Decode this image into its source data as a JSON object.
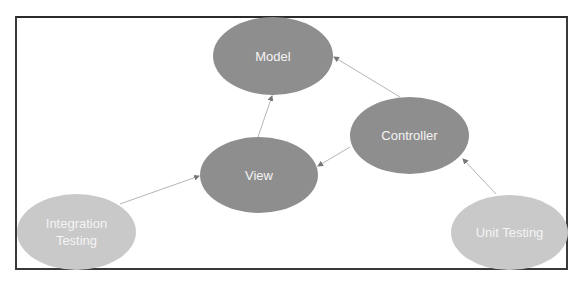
{
  "diagram": {
    "title": "",
    "colors": {
      "primary_node": "#8e8e8e",
      "secondary_node": "#c9c9c9",
      "node_text": "#f4f4f4",
      "edge": "#b5b5b5",
      "frame": "#3a3a3a"
    },
    "nodes": [
      {
        "id": "model",
        "label": "Model",
        "style": "dark"
      },
      {
        "id": "view",
        "label": "View",
        "style": "dark"
      },
      {
        "id": "controller",
        "label": "Controller",
        "style": "dark"
      },
      {
        "id": "integration",
        "label": "Integration Testing",
        "line1": "Integration",
        "line2": "Testing",
        "style": "light"
      },
      {
        "id": "unit",
        "label": "Unit Testing",
        "style": "light"
      }
    ],
    "edges": [
      {
        "from": "view",
        "to": "model"
      },
      {
        "from": "controller",
        "to": "model"
      },
      {
        "from": "controller",
        "to": "view"
      },
      {
        "from": "integration",
        "to": "view"
      },
      {
        "from": "unit",
        "to": "controller"
      }
    ]
  }
}
